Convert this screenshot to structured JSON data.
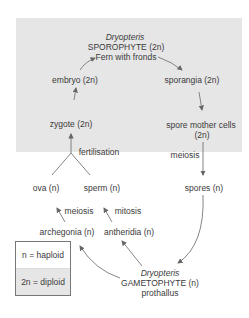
{
  "diagram": {
    "sporophyte": {
      "genus": "Dryopteris",
      "name": "SPOROPHYTE",
      "ploidy": "(2n)",
      "desc": "Fern with fronds"
    },
    "gametophyte": {
      "genus": "Dryopteris",
      "name": "GAMETOPHYTE",
      "ploidy": "(n)",
      "desc": "prothallus"
    },
    "nodes": {
      "sporangia": "sporangia (2n)",
      "spore_mother_cells_1": "spore mother cells",
      "spore_mother_cells_2": "(2n)",
      "spores": "spores (n)",
      "archegonia": "archegonia (n)",
      "antheridia": "antheridia (n)",
      "ova": "ova (n)",
      "sperm": "sperm (n)",
      "zygote": "zygote (2n)",
      "embryo": "embryo (2n)"
    },
    "processes": {
      "meiosis_spores": "meiosis",
      "meiosis_ova": "meiosis",
      "mitosis_sperm": "mitosis",
      "fertilisation": "fertilisation"
    },
    "legend": {
      "haploid": "n = haploid",
      "diploid": "2n = diploid"
    },
    "colors": {
      "diploid_shade": "#e6e6e6",
      "arrow": "#666666",
      "text": "#3a3a3a"
    }
  }
}
